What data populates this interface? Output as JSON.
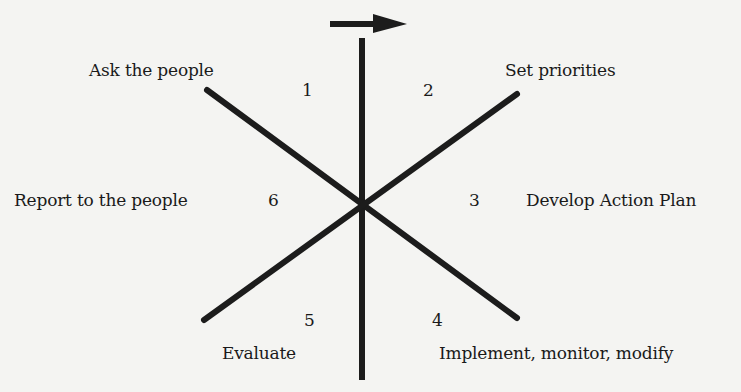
{
  "diagram": {
    "type": "cycle-star",
    "direction_arrow": "right",
    "colors": {
      "lines": "#1c1c1c",
      "background": "#f4f4f2",
      "text": "#1a1a1a"
    },
    "steps": [
      {
        "number": "1",
        "label": "Ask the people"
      },
      {
        "number": "2",
        "label": "Set priorities"
      },
      {
        "number": "3",
        "label": "Develop Action Plan"
      },
      {
        "number": "4",
        "label": "Implement, monitor, modify"
      },
      {
        "number": "5",
        "label": "Evaluate"
      },
      {
        "number": "6",
        "label": "Report to the people"
      }
    ]
  }
}
